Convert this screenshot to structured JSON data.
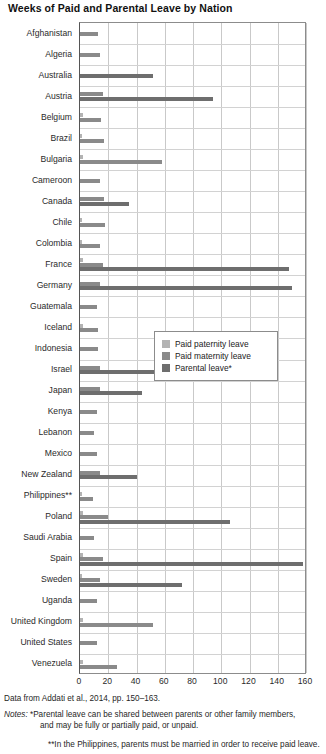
{
  "chart_data": {
    "type": "bar",
    "orientation": "horizontal",
    "title": "Weeks of Paid and Parental Leave by Nation",
    "xlabel": "",
    "ylabel": "",
    "xlim": [
      0,
      160
    ],
    "xticks": [
      0,
      20,
      40,
      60,
      80,
      100,
      120,
      140,
      160
    ],
    "grid": true,
    "legend_position": "middle-right",
    "categories": [
      "Afghanistan",
      "Algeria",
      "Australia",
      "Austria",
      "Belgium",
      "Brazil",
      "Bulgaria",
      "Cameroon",
      "Canada",
      "Chile",
      "Colombia",
      "France",
      "Germany",
      "Guatemala",
      "Iceland",
      "Indonesia",
      "Israel",
      "Japan",
      "Kenya",
      "Lebanon",
      "Mexico",
      "New Zealand",
      "Philippines**",
      "Poland",
      "Saudi Arabia",
      "Spain",
      "Sweden",
      "Uganda",
      "United Kingdom",
      "United States",
      "Venezuela"
    ],
    "series": [
      {
        "name": "Paid paternity leave",
        "color": "#b3b3b3",
        "values": [
          0,
          0,
          0,
          0,
          2,
          1,
          2,
          0,
          0,
          1,
          1,
          2,
          0,
          0,
          2,
          0,
          0,
          0,
          0,
          0,
          0,
          0,
          1,
          2,
          0,
          2,
          1.5,
          0,
          2,
          0,
          2
        ]
      },
      {
        "name": "Paid maternity leave",
        "color": "#8a8a8a",
        "values": [
          13,
          14,
          0,
          16,
          15,
          17,
          58,
          14,
          17,
          18,
          14,
          16,
          14,
          12,
          13,
          13,
          14,
          14,
          12,
          10,
          12,
          14,
          9,
          20,
          10,
          16,
          14,
          12,
          52,
          12,
          26
        ]
      },
      {
        "name": "Parental leave*",
        "color": "#6e6e6e",
        "values": [
          0,
          0,
          52,
          94,
          0,
          0,
          0,
          0,
          35,
          0,
          0,
          148,
          150,
          0,
          0,
          0,
          53,
          44,
          0,
          0,
          0,
          40,
          0,
          106,
          0,
          158,
          72,
          0,
          0,
          0,
          0
        ]
      }
    ]
  },
  "legend": {
    "items": [
      {
        "label": "Paid paternity leave",
        "color": "#b3b3b3"
      },
      {
        "label": "Paid maternity leave",
        "color": "#8a8a8a"
      },
      {
        "label": "Parental leave*",
        "color": "#6e6e6e"
      }
    ]
  },
  "footnotes": {
    "source": "Data from Addati et al., 2014, pp. 150–163.",
    "notes_label": "Notes:",
    "note1_line1": "*Parental leave can be shared between parents or other family members,",
    "note1_line2": "and may be fully or partially paid, or unpaid.",
    "note2": "**In the Philippines, parents must be married in order to receive paid leave."
  }
}
